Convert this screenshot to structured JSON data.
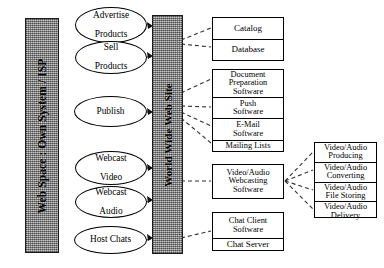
{
  "diagram": {
    "type": "block-flow-diagram",
    "colors": {
      "bar_fill": "#9a9a9a",
      "outline": "#000000",
      "box_fill": "#ffffff",
      "connector": "#333333"
    }
  },
  "bars": [
    {
      "id": "web-space",
      "label": "Web Space : Own System / ISP"
    },
    {
      "id": "www-site",
      "label": "World Wide Web Site"
    }
  ],
  "activities": [
    {
      "id": "advertise-products",
      "lines": [
        "Advertise",
        "Products"
      ]
    },
    {
      "id": "sell-products",
      "lines": [
        "Sell",
        "Products"
      ]
    },
    {
      "id": "publish",
      "lines": [
        "Publish"
      ]
    },
    {
      "id": "webcast-video",
      "lines": [
        "Webcast",
        "Video"
      ]
    },
    {
      "id": "webcast-audio",
      "lines": [
        "Webcast",
        "Audio"
      ]
    },
    {
      "id": "host-chats",
      "lines": [
        "Host Chats"
      ]
    }
  ],
  "components": {
    "commerce": {
      "id": "commerce-group",
      "cells": [
        {
          "lines": [
            "Catalog"
          ]
        },
        {
          "lines": [
            "Database"
          ]
        }
      ]
    },
    "publishing": {
      "id": "publishing-group",
      "cells": [
        {
          "lines": [
            "Document",
            "Preparation",
            "Software"
          ]
        },
        {
          "lines": [
            "Push",
            "Software"
          ]
        },
        {
          "lines": [
            "E-Mail",
            "Software"
          ]
        },
        {
          "lines": [
            "Mailing Lists"
          ]
        }
      ]
    },
    "webcasting": {
      "id": "webcasting-group",
      "cells": [
        {
          "lines": [
            "Video/Audio",
            "Webcasting",
            "Software"
          ]
        }
      ]
    },
    "chat": {
      "id": "chat-group",
      "cells": [
        {
          "lines": [
            "Chat Client",
            "Software"
          ]
        },
        {
          "lines": [
            "Chat Server"
          ]
        }
      ]
    },
    "media_pipeline": {
      "id": "media-pipeline-group",
      "cells": [
        {
          "lines": [
            "Video/Audio",
            "Producing"
          ]
        },
        {
          "lines": [
            "Video/Audio",
            "Converting"
          ]
        },
        {
          "lines": [
            "Video/Audio",
            "File Storing"
          ]
        },
        {
          "lines": [
            "Video/Audio",
            "Delivery"
          ]
        }
      ]
    }
  }
}
